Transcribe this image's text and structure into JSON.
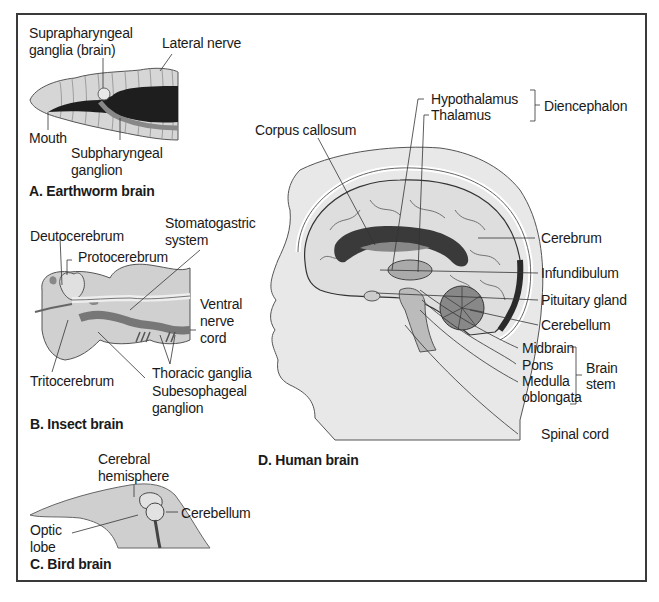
{
  "figure": {
    "panels": [
      {
        "id": "A",
        "title": "A. Earthworm brain",
        "labels": {
          "suprapharyngeal_1": "Suprapharyngeal",
          "suprapharyngeal_2": "ganglia (brain)",
          "lateral_nerve": "Lateral nerve",
          "mouth": "Mouth",
          "subpharyngeal_1": "Subpharyngeal",
          "subpharyngeal_2": "ganglion"
        }
      },
      {
        "id": "B",
        "title": "B. Insect brain",
        "labels": {
          "stomatogastric_1": "Stomatogastric",
          "stomatogastric_2": "system",
          "deutocerebrum": "Deutocerebrum",
          "protocerebrum": "Protocerebrum",
          "ventral_1": "Ventral",
          "ventral_2": "nerve",
          "ventral_3": "cord",
          "thoracic_ganglia": "Thoracic ganglia",
          "tritocerebrum": "Tritocerebrum",
          "subesophageal_1": "Subesophageal",
          "subesophageal_2": "ganglion"
        }
      },
      {
        "id": "C",
        "title": "C. Bird brain",
        "labels": {
          "cerebral_1": "Cerebral",
          "cerebral_2": "hemisphere",
          "cerebellum": "Cerebellum",
          "optic_1": "Optic",
          "optic_2": "lobe"
        }
      },
      {
        "id": "D",
        "title": "D. Human brain",
        "labels": {
          "hypothalamus": "Hypothalamus",
          "thalamus": "Thalamus",
          "diencephalon": "Diencephalon",
          "corpus_callosum": "Corpus callosum",
          "cerebrum": "Cerebrum",
          "infundibulum": "Infundibulum",
          "pituitary_gland": "Pituitary gland",
          "cerebellum": "Cerebellum",
          "midbrain": "Midbrain",
          "pons": "Pons",
          "medulla_1": "Medulla",
          "medulla_2": "oblongata",
          "brain_stem_1": "Brain",
          "brain_stem_2": "stem",
          "spinal_cord": "Spinal cord"
        }
      }
    ]
  },
  "colors": {
    "frame": "#3a3a3a",
    "tissue_light": "#d4d4d4",
    "tissue_mid": "#8a8a8a",
    "tissue_dark": "#2a2a2a",
    "skin": "#e6e6e6"
  }
}
